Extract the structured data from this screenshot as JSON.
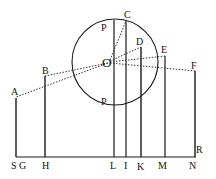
{
  "diagram": {
    "colors": {
      "ink": "#1a1a1a",
      "background": "#ffffff"
    },
    "circle": {
      "cx": 115,
      "cy": 62,
      "r": 43
    },
    "center_label": "O",
    "labels": {
      "P_top": "P",
      "P_bottom": "P",
      "C": "C",
      "D": "D",
      "E": "E",
      "F": "F",
      "A": "A",
      "B": "B",
      "S": "S",
      "G": "G",
      "H": "H",
      "L": "L",
      "I": "I",
      "K": "K",
      "M": "M",
      "N": "N",
      "R": "R"
    }
  }
}
